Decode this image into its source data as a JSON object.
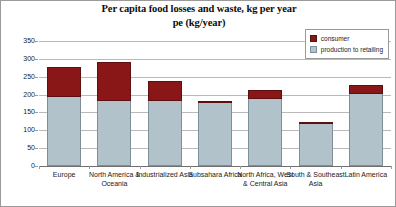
{
  "chart_data": {
    "type": "bar",
    "stacked": true,
    "title": "Per capita food losses and waste, kg per year\npe (kg/year)",
    "title_lines": [
      "Per capita food losses and waste, kg per year",
      "pe (kg/year)"
    ],
    "xlabel": "",
    "ylabel": "",
    "ylim": [
      0,
      350
    ],
    "yticks": [
      0,
      50,
      100,
      150,
      200,
      250,
      300,
      350
    ],
    "ytick_labels": [
      "0",
      "50",
      "100",
      "150",
      "200",
      "250",
      "300",
      "350"
    ],
    "grid": true,
    "legend_position": "top-right",
    "categories": [
      "Europe",
      "North America & Oceania",
      "Industrialized Asia",
      "Subsahara Africa",
      "North Africa, West & Central Asia",
      "South & Southeast Asia",
      "Latin America"
    ],
    "series": [
      {
        "name": "production to retailing",
        "color": "#b2c2ca",
        "values": [
          195,
          185,
          185,
          180,
          190,
          120,
          205
        ]
      },
      {
        "name": "consumer",
        "color": "#8a1717",
        "values": [
          85,
          110,
          55,
          6,
          27,
          6,
          25
        ]
      }
    ],
    "totals": [
      280,
      295,
      240,
      186,
      217,
      126,
      230
    ]
  },
  "legend": {
    "items": [
      {
        "label": "consumer",
        "swatch": "#8a1717"
      },
      {
        "label": "production to retailing",
        "swatch": "#b2c2ca"
      }
    ]
  }
}
